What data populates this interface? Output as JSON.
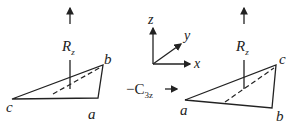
{
  "diagram": {
    "left": {
      "rotation_label": "R",
      "rotation_sub": "z",
      "vertices": {
        "top_right": "b",
        "left": "c",
        "bottom": "a"
      }
    },
    "axes": {
      "z": "z",
      "y": "y",
      "x": "x"
    },
    "operation": {
      "prefix": "−C",
      "sub": "3z",
      "arrow": "→"
    },
    "right": {
      "rotation_label": "R",
      "rotation_sub": "z",
      "vertices": {
        "top_right": "c",
        "left": "a",
        "bottom": "b"
      }
    },
    "colors": {
      "stroke": "#222222",
      "background": "#ffffff"
    }
  }
}
